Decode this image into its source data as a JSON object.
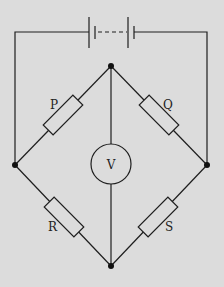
{
  "diagram": {
    "background": "#dcdcdc",
    "line_color": "#1e1e1e",
    "components": {
      "battery": {
        "label": "battery",
        "cells": 2
      },
      "resistors": [
        {
          "id": "P",
          "label": "P"
        },
        {
          "id": "Q",
          "label": "Q"
        },
        {
          "id": "R",
          "label": "R"
        },
        {
          "id": "S",
          "label": "S"
        }
      ],
      "voltmeter": {
        "label": "V"
      }
    }
  }
}
